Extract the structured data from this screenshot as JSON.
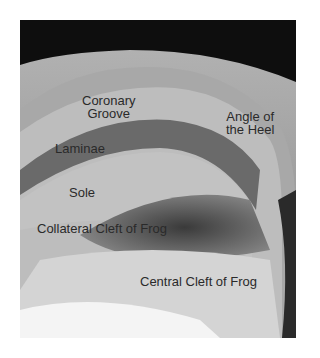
{
  "figure": {
    "labels": {
      "coronary_groove_line1": "Coronary",
      "coronary_groove_line2": "Groove",
      "angle_heel_line1": "Angle of",
      "angle_heel_line2": "the Heel",
      "laminae": "Laminae",
      "sole": "Sole",
      "collateral_cleft": "Collateral Cleft of Frog",
      "central_cleft": "Central Cleft of Frog"
    }
  }
}
